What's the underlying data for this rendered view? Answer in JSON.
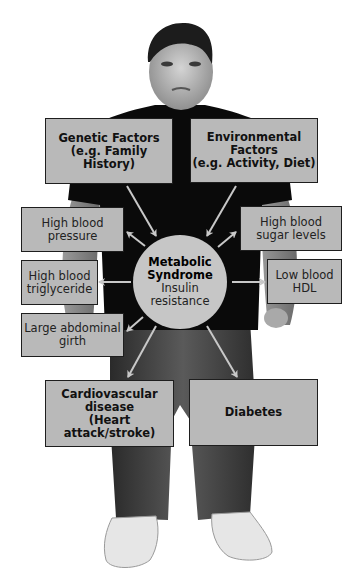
{
  "diagram": {
    "center": {
      "title_line1": "Metabolic",
      "title_line2": "Syndrome",
      "subtitle_line1": "Insulin",
      "subtitle_line2": "resistance"
    },
    "causes": [
      {
        "id": "genetic",
        "lines": [
          "Genetic Factors",
          "(e.g. Family History)"
        ]
      },
      {
        "id": "environmental",
        "lines": [
          "Environmental",
          "Factors",
          "(e.g. Activity, Diet)"
        ]
      }
    ],
    "components": [
      {
        "id": "high-blood-pressure",
        "lines": [
          "High blood",
          "pressure"
        ]
      },
      {
        "id": "high-blood-triglyceride",
        "lines": [
          "High blood",
          "triglyceride"
        ]
      },
      {
        "id": "large-abdominal-girth",
        "lines": [
          "Large abdominal",
          "girth"
        ]
      },
      {
        "id": "high-blood-sugar",
        "lines": [
          "High blood",
          "sugar levels"
        ]
      },
      {
        "id": "low-blood-hdl",
        "lines": [
          "Low blood",
          "HDL"
        ]
      }
    ],
    "outcomes": [
      {
        "id": "cardiovascular",
        "lines": [
          "Cardiovascular",
          "disease",
          "(Heart attack/stroke)"
        ]
      },
      {
        "id": "diabetes",
        "lines": [
          "Diabetes"
        ]
      }
    ],
    "colors": {
      "box_fill": "#b9b9b9",
      "box_border": "#1e1e1e",
      "circle_fill": "#c6c6c6",
      "arrow": "#c8c8c8",
      "shirt": "#0a0a0a",
      "pants": "#3a3a3a"
    }
  }
}
